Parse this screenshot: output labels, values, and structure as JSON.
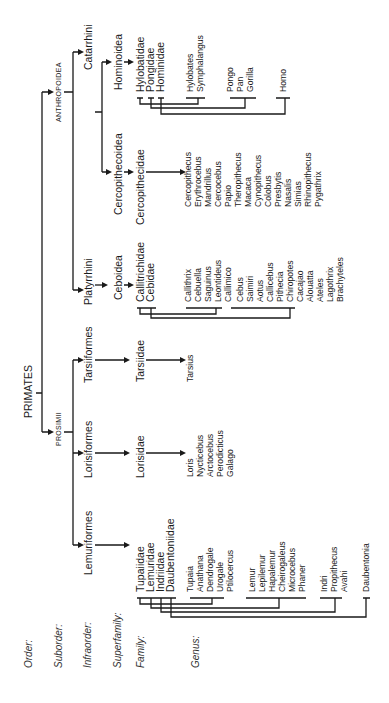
{
  "levels": {
    "order": "Order:",
    "suborder": "Suborder:",
    "infraorder": "Infraorder:",
    "superfamily": "Superfamily:",
    "family": "Family:",
    "genus": "Genus:"
  },
  "order": {
    "name": "PRIMATES"
  },
  "suborders": {
    "anthropoidea": "ANTHROPOIDEA",
    "prosimii": "PROSIMII"
  },
  "infraorders": {
    "catarrhini": "Catarrhini",
    "platyrrhini": "Platyrrhini",
    "tarsiiformes": "Tarsiiformes",
    "lorisiformes": "Lorisiformes",
    "lemuriformes": "Lemuriformes"
  },
  "superfamilies": {
    "hominoidea": "Hominoidea",
    "cercopithecoidea": "Cercopithecoidea",
    "ceboidea": "Ceboidea"
  },
  "families": {
    "hylobatidae": "Hylobatidae",
    "pongidae": "Pongidae",
    "hominidae": "Hominidae",
    "cercopithecidae": "Cercopithecidae",
    "callitrichidae": "Callitrichidae",
    "cebidae": "Cebidae",
    "tarsiidae": "Tarsiidae",
    "lorisidae": "Lorisidae",
    "tupaiidae": "Tupaiidae",
    "lemuridae": "Lemuridae",
    "indriidae": "Indriidae",
    "daubentoniidae": "Daubentoniidae"
  },
  "genera": {
    "hylobatidae": [
      "Hylobates",
      "Symphalangus"
    ],
    "pongidae": [
      "Pongo",
      "Pan",
      "Gorilla"
    ],
    "hominidae": [
      "Homo"
    ],
    "cercopithecidae": [
      "Cercopithecus",
      "Erythrocebus",
      "Mandrillus",
      "Cercocebus",
      "Papio",
      "Theropithecus",
      "Macaca",
      "Cynopithecus",
      "Colobus",
      "Presbytis",
      "Nasalis",
      "Simias",
      "Rhinopithecus",
      "Pygathrix"
    ],
    "callitrichidae": [
      "Callithrix",
      "Cebuella",
      "Saguinus",
      "Leontideus",
      "Callimico"
    ],
    "cebidae": [
      "Cebus",
      "Saimiri",
      "Aotus",
      "Callicebus",
      "Pithecia",
      "Chiropotes",
      "Cacajao",
      "Alouatta",
      "Ateles",
      "Lagothrix",
      "Brachyteles"
    ],
    "tarsiidae": [
      "Tarsius"
    ],
    "lorisidae": [
      "Loris",
      "Nycticebus",
      "Arctocebus",
      "Perodicticus",
      "Galago"
    ],
    "tupaiidae": [
      "Tupaia",
      "Anathana",
      "Dendrogale",
      "Urogale",
      "Ptilocercus"
    ],
    "lemuridae": [
      "Lemur",
      "Lepilemur",
      "Hapalemur",
      "Cheirogaleus",
      "Microcebus",
      "Phaner"
    ],
    "indriidae": [
      "Indri",
      "Propithecus",
      "Avahi"
    ],
    "daubentoniidae": [
      "Daubentonia"
    ]
  }
}
